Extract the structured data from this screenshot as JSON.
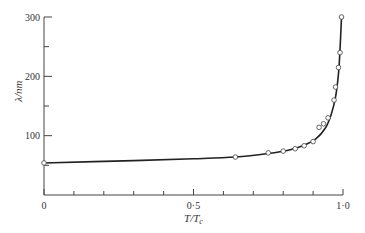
{
  "chart_data": {
    "type": "line",
    "title": "",
    "xlabel": "T/Tc",
    "ylabel": "λ/nm",
    "xlim": [
      0,
      1.0
    ],
    "ylim": [
      0,
      300
    ],
    "grid": false,
    "legend": null,
    "x_ticks": [
      {
        "value": 0,
        "label": "0"
      },
      {
        "value": 0.5,
        "label": "0·5"
      },
      {
        "value": 1.0,
        "label": "1·0"
      }
    ],
    "x_minor_ticks": [
      0.1,
      0.2,
      0.3,
      0.4,
      0.6,
      0.7,
      0.8,
      0.9
    ],
    "y_ticks": [
      {
        "value": 100,
        "label": "100"
      },
      {
        "value": 200,
        "label": "200"
      },
      {
        "value": 300,
        "label": "300"
      }
    ],
    "y_minor_ticks": [
      50,
      150,
      250
    ],
    "series": [
      {
        "name": "measured",
        "style": "open-circle markers",
        "x": [
          0.0,
          0.64,
          0.75,
          0.8,
          0.84,
          0.87,
          0.9,
          0.92,
          0.935,
          0.95,
          0.97,
          0.975,
          0.985,
          0.99,
          0.995
        ],
        "y": [
          54,
          64,
          71,
          74,
          78,
          83,
          90,
          114,
          120,
          130,
          160,
          182,
          215,
          240,
          300
        ]
      },
      {
        "name": "theory",
        "style": "solid line",
        "x": [
          0.0,
          0.3,
          0.5,
          0.64,
          0.75,
          0.82,
          0.87,
          0.91,
          0.94,
          0.96,
          0.975,
          0.985,
          0.99,
          0.995
        ],
        "y": [
          54,
          58,
          61,
          64,
          70,
          76,
          84,
          95,
          112,
          135,
          165,
          205,
          245,
          300
        ]
      }
    ]
  }
}
